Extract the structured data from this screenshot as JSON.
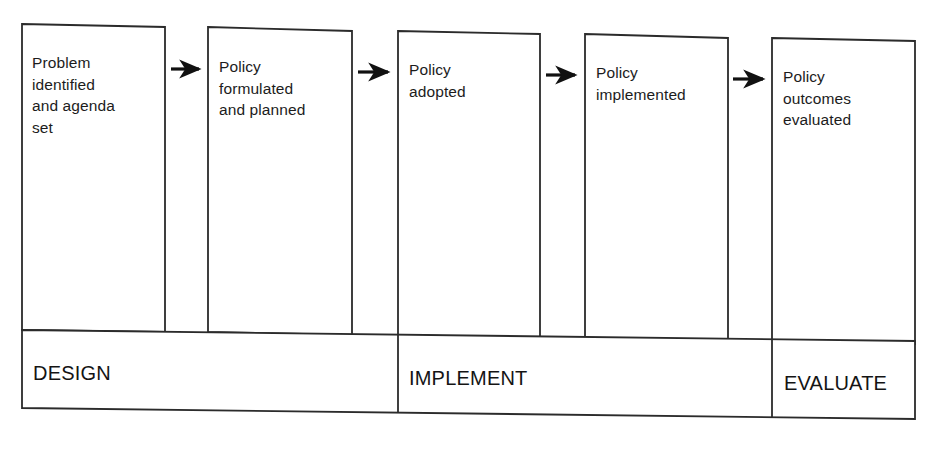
{
  "diagram": {
    "stroke_color": "#2b2b2b",
    "background_color": "#ffffff",
    "text_color": "#1c1c1c",
    "arrow_color": "#111111",
    "stages": [
      {
        "id": "stage-problem-identified",
        "label": "Problem\nidentified\nand agenda\nset",
        "line1": "Problem",
        "line2": "identified",
        "line3": "and agenda",
        "line4": "set",
        "x": 22,
        "y": 24,
        "width": 143,
        "height": 306,
        "text_x": 32,
        "text_y": 54
      },
      {
        "id": "stage-policy-formulated",
        "label": "Policy\nformulated\nand planned",
        "line1": "Policy",
        "line2": "formulated",
        "line3": "and planned",
        "x": 208,
        "y": 27,
        "width": 144,
        "height": 304,
        "text_x": 218,
        "text_y": 57
      },
      {
        "id": "stage-policy-adopted",
        "label": "Policy\nadopted",
        "line1": "Policy",
        "line2": "adopted",
        "x": 398,
        "y": 30,
        "width": 142,
        "height": 302,
        "text_x": 408,
        "text_y": 60
      },
      {
        "id": "stage-policy-implemented",
        "label": "Policy\nimplemented",
        "line1": "Policy",
        "line2": "implemented",
        "x": 585,
        "y": 33,
        "width": 143,
        "height": 301,
        "text_x": 595,
        "text_y": 62
      },
      {
        "id": "stage-policy-outcomes-evaluated",
        "label": "Policy\noutcomes\nevaluated",
        "line1": "Policy",
        "line2": "outcomes",
        "line3": "evaluated",
        "x": 772,
        "y": 36,
        "width": 143,
        "height": 300,
        "text_x": 782,
        "text_y": 65
      }
    ],
    "arrows": [
      {
        "id": "arrow-1",
        "from": "stage-problem-identified",
        "to": "stage-policy-formulated",
        "x1": 170,
        "y1": 69,
        "x2": 203,
        "y2": 69
      },
      {
        "id": "arrow-2",
        "from": "stage-policy-formulated",
        "to": "stage-policy-adopted",
        "x1": 357,
        "y1": 72,
        "x2": 392,
        "y2": 72
      },
      {
        "id": "arrow-3",
        "from": "stage-policy-adopted",
        "to": "stage-policy-implemented",
        "x1": 545,
        "y1": 75,
        "x2": 579,
        "y2": 75
      },
      {
        "id": "arrow-4",
        "from": "stage-policy-implemented",
        "to": "stage-policy-outcomes-evaluated",
        "x1": 733,
        "y1": 78,
        "x2": 767,
        "y2": 78
      }
    ],
    "phases": [
      {
        "id": "phase-design",
        "label": "DESIGN",
        "spans_stages": [
          "stage-problem-identified",
          "stage-policy-formulated"
        ],
        "x": 22,
        "width": 376,
        "text_x": 33,
        "text_y": 362
      },
      {
        "id": "phase-implement",
        "label": "IMPLEMENT",
        "spans_stages": [
          "stage-policy-adopted",
          "stage-policy-implemented"
        ],
        "x": 398,
        "width": 374,
        "text_x": 408,
        "text_y": 368
      },
      {
        "id": "phase-evaluate",
        "label": "EVALUATE",
        "spans_stages": [
          "stage-policy-outcomes-evaluated"
        ],
        "x": 772,
        "width": 143,
        "text_x": 784,
        "text_y": 374
      }
    ],
    "phase_band": {
      "id": "phase-band",
      "left": 22,
      "right": 915,
      "top_left_y": 330,
      "top_right_y": 336,
      "bottom_left_y": 408,
      "bottom_right_y": 414
    }
  }
}
